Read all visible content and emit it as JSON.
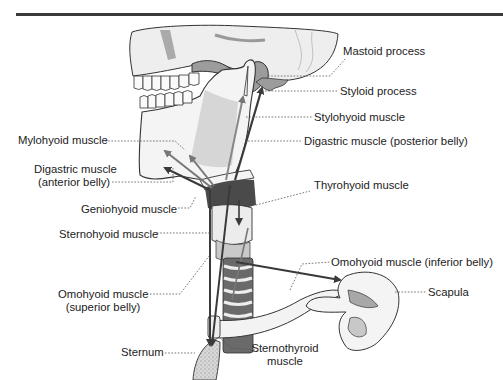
{
  "figure": {
    "type": "anatomical-diagram",
    "colors": {
      "bone": "#f2f2f2",
      "bone_outline": "#333333",
      "shade": "#b8b8b8",
      "dark_shade": "#8a8a8a",
      "arrow": "#3a3a3a",
      "leader": "#555555",
      "rule": "#3a3a3a"
    }
  },
  "labels": {
    "mastoid_process": "Mastoid process",
    "styloid_process": "Styloid process",
    "stylohyoid_muscle": "Stylohyoid muscle",
    "mylohyoid_muscle": "Mylohyoid muscle",
    "digastric_posterior": "Digastric muscle (posterior belly)",
    "digastric_anterior_line1": "Digastric muscle",
    "digastric_anterior_line2": "(anterior belly)",
    "thyrohyoid_muscle": "Thyrohyoid muscle",
    "geniohyoid_muscle": "Geniohyoid muscle",
    "sternohyoid_muscle": "Sternohyoid muscle",
    "omohyoid_inferior": "Omohyoid muscle (inferior belly)",
    "omohyoid_superior_line1": "Omohyoid muscle",
    "omohyoid_superior_line2": "(superior belly)",
    "scapula": "Scapula",
    "sternum": "Sternum",
    "sternothyroid_line1": "Sternothyroid",
    "sternothyroid_line2": "muscle"
  }
}
